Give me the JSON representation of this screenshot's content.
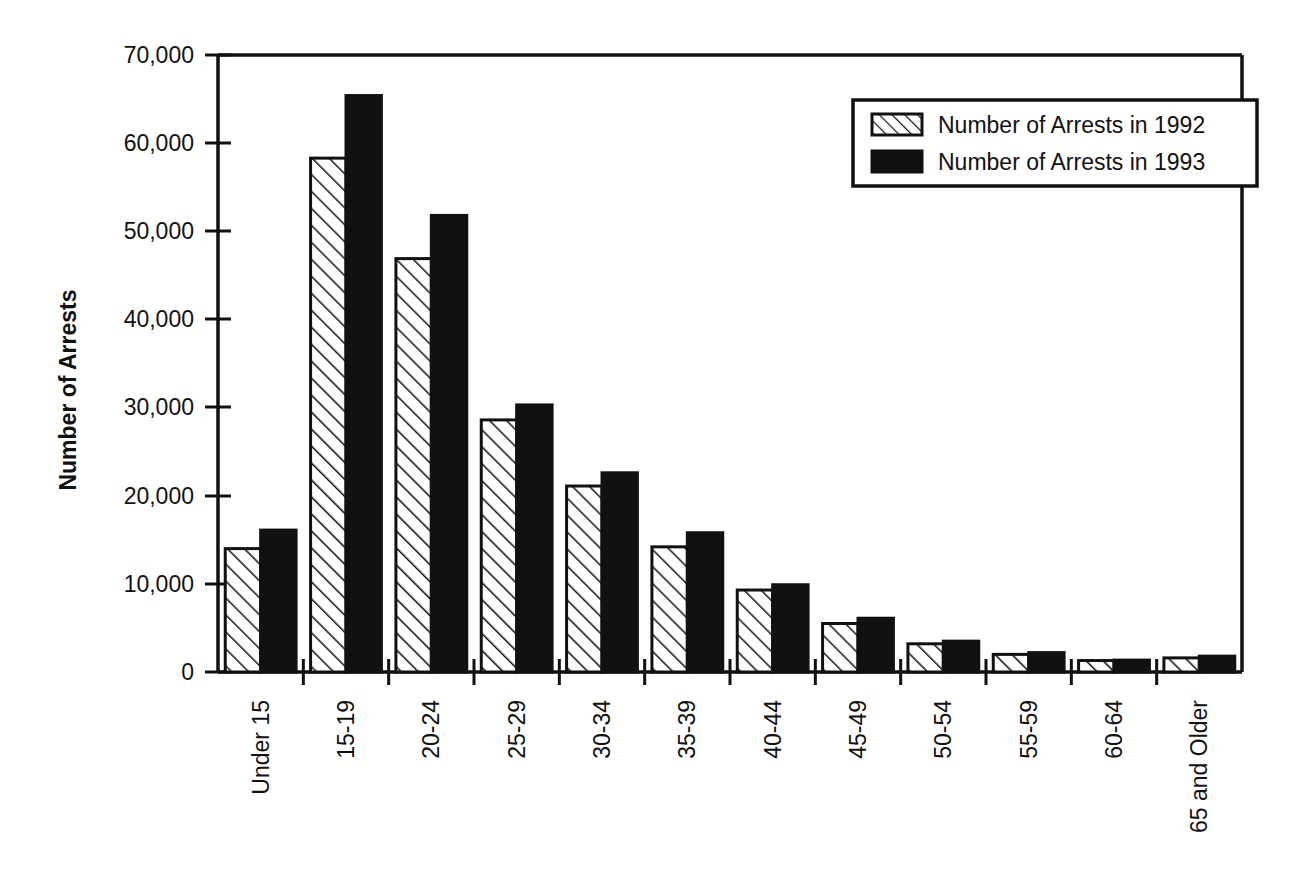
{
  "chart_data": {
    "type": "bar",
    "title": "",
    "subtitle": "",
    "xlabel": "",
    "ylabel": "Number of Arrests",
    "ylim": [
      0,
      70000
    ],
    "ytick_values": [
      0,
      10000,
      20000,
      30000,
      40000,
      50000,
      60000,
      70000
    ],
    "ytick_labels": [
      "0",
      "10,000",
      "20,000",
      "30,000",
      "40,000",
      "50,000",
      "60,000",
      "70,000"
    ],
    "grid": false,
    "legend_position": "top-right",
    "categories": [
      "Under 15",
      "15-19",
      "20-24",
      "25-29",
      "30-34",
      "35-39",
      "40-44",
      "45-49",
      "50-54",
      "55-59",
      "60-64",
      "65 and Older"
    ],
    "series": [
      {
        "name": "Number of Arrests in 1992",
        "fill": "hatched",
        "color": "#ffffff",
        "values": [
          14000,
          58300,
          46900,
          28600,
          21100,
          14200,
          9300,
          5500,
          3200,
          2000,
          1300,
          1600
        ]
      },
      {
        "name": "Number of Arrests in 1993",
        "fill": "solid",
        "color": "#111111",
        "values": [
          16100,
          65400,
          51800,
          30300,
          22600,
          15800,
          9900,
          6100,
          3500,
          2200,
          1350,
          1800
        ]
      }
    ],
    "annotations": []
  },
  "legend": {
    "entries": [
      {
        "label": "Number of Arrests in 1992",
        "swatch": "hatched-swatch"
      },
      {
        "label": "Number of Arrests in 1993",
        "swatch": "solid-swatch"
      }
    ]
  },
  "colors": {
    "axis": "#111111",
    "series_1993": "#111111",
    "series_1992_outline": "#111111",
    "background": "#ffffff"
  }
}
